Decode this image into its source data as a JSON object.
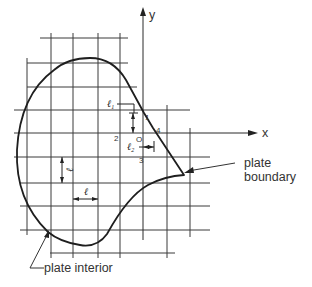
{
  "figure": {
    "type": "finite-difference grid over plate",
    "axes": {
      "x_label": "x",
      "y_label": "y"
    },
    "node_labels": {
      "origin": "O",
      "n1": "1",
      "n2": "2",
      "n3": "3",
      "n4": "4"
    },
    "dimension_labels": {
      "l1": "ℓ",
      "l1_sub": "1",
      "l2": "ℓ",
      "l2_sub": "2",
      "spacing_vertical": "ℓ",
      "spacing_horizontal": "ℓ"
    },
    "callouts": {
      "boundary_line1": "plate",
      "boundary_line2": "boundary",
      "interior": "plate interior"
    },
    "colors": {
      "ink": "#222222",
      "background": "#ffffff"
    }
  }
}
